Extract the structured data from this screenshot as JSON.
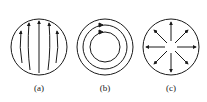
{
  "figure": {
    "panels": [
      {
        "id": "a",
        "label": "(a)",
        "description": "parallel field lines pointing upward inside a circle"
      },
      {
        "id": "b",
        "label": "(b)",
        "description": "concentric circular field lines with arrows"
      },
      {
        "id": "c",
        "label": "(c)",
        "description": "radial field lines pointing outward from center"
      }
    ],
    "stroke_color": "#1a1a1a",
    "background": "#ffffff"
  }
}
